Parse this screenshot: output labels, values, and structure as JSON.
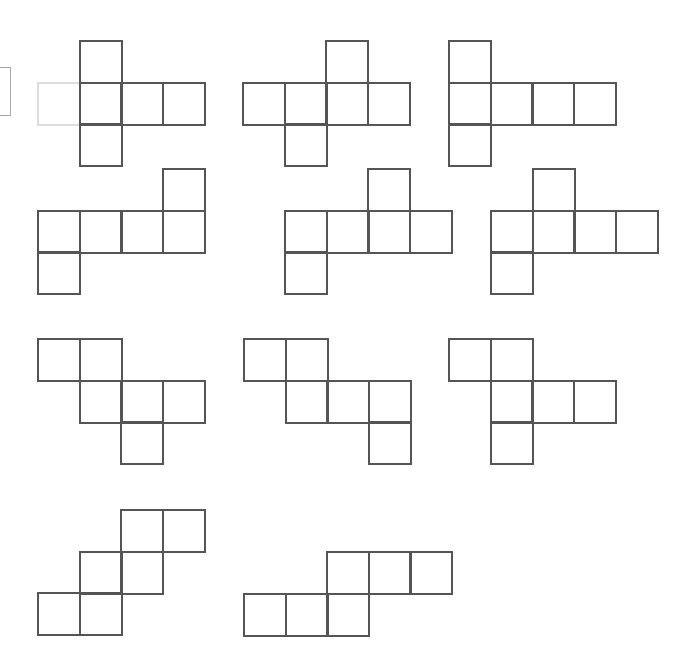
{
  "diagram": {
    "title": "",
    "cell_size": 41.5,
    "line_color": "#555555",
    "faint_line_color": "#dcdcdc",
    "background": "#ffffff",
    "nets": [
      {
        "id": 1,
        "origin": [
          37,
          40
        ],
        "cells": [
          [
            1,
            0
          ],
          [
            0,
            1
          ],
          [
            1,
            1
          ],
          [
            2,
            1
          ],
          [
            3,
            1
          ],
          [
            1,
            2
          ]
        ],
        "faint_cells": [
          [
            0,
            1
          ]
        ]
      },
      {
        "id": 2,
        "origin": [
          242,
          40
        ],
        "cells": [
          [
            2,
            0
          ],
          [
            0,
            1
          ],
          [
            1,
            1
          ],
          [
            2,
            1
          ],
          [
            3,
            1
          ],
          [
            1,
            2
          ]
        ]
      },
      {
        "id": 3,
        "origin": [
          448,
          40
        ],
        "cells": [
          [
            0,
            0
          ],
          [
            0,
            1
          ],
          [
            1,
            1
          ],
          [
            2,
            1
          ],
          [
            3,
            1
          ],
          [
            0,
            2
          ]
        ]
      },
      {
        "id": 4,
        "origin": [
          37,
          168
        ],
        "cells": [
          [
            3,
            0
          ],
          [
            0,
            1
          ],
          [
            1,
            1
          ],
          [
            2,
            1
          ],
          [
            3,
            1
          ],
          [
            0,
            2
          ]
        ]
      },
      {
        "id": 5,
        "origin": [
          284,
          168
        ],
        "cells": [
          [
            2,
            0
          ],
          [
            0,
            1
          ],
          [
            1,
            1
          ],
          [
            2,
            1
          ],
          [
            3,
            1
          ],
          [
            0,
            2
          ]
        ]
      },
      {
        "id": 6,
        "origin": [
          490,
          168
        ],
        "cells": [
          [
            1,
            0
          ],
          [
            0,
            1
          ],
          [
            1,
            1
          ],
          [
            2,
            1
          ],
          [
            3,
            1
          ],
          [
            0,
            2
          ]
        ]
      },
      {
        "id": 7,
        "origin": [
          37,
          338
        ],
        "cells": [
          [
            0,
            0
          ],
          [
            1,
            0
          ],
          [
            1,
            1
          ],
          [
            2,
            1
          ],
          [
            3,
            1
          ],
          [
            2,
            2
          ]
        ]
      },
      {
        "id": 8,
        "origin": [
          243,
          338
        ],
        "cells": [
          [
            0,
            0
          ],
          [
            1,
            0
          ],
          [
            1,
            1
          ],
          [
            2,
            1
          ],
          [
            3,
            1
          ],
          [
            3,
            2
          ]
        ]
      },
      {
        "id": 9,
        "origin": [
          448,
          338
        ],
        "cells": [
          [
            0,
            0
          ],
          [
            1,
            0
          ],
          [
            1,
            1
          ],
          [
            2,
            1
          ],
          [
            3,
            1
          ],
          [
            1,
            2
          ]
        ]
      },
      {
        "id": 10,
        "origin": [
          37,
          509
        ],
        "cells": [
          [
            2,
            0
          ],
          [
            3,
            0
          ],
          [
            1,
            1
          ],
          [
            2,
            1
          ],
          [
            0,
            2
          ],
          [
            1,
            2
          ]
        ]
      },
      {
        "id": 11,
        "origin": [
          243,
          551
        ],
        "cells": [
          [
            2,
            0
          ],
          [
            3,
            0
          ],
          [
            4,
            0
          ],
          [
            0,
            1
          ],
          [
            1,
            1
          ],
          [
            2,
            1
          ]
        ]
      }
    ]
  }
}
